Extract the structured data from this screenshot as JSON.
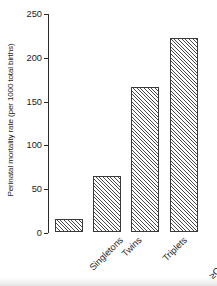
{
  "chart_data": {
    "type": "bar",
    "title": "",
    "subtitle": "",
    "xlabel": "",
    "ylabel": "Perinatal mortality rate (per 1000 total births)",
    "categories": [
      "Singletons",
      "Twins",
      "Triplets",
      "≥Quadruplets"
    ],
    "values": [
      15,
      64,
      165,
      221
    ],
    "ylim": [
      0,
      250
    ],
    "yticks": [
      0,
      50,
      100,
      150,
      200,
      250
    ],
    "ytick_labels": [
      "0",
      "50",
      "100",
      "150",
      "200",
      "250"
    ],
    "grid": false,
    "legend": null,
    "series": [
      {
        "name": "Perinatal mortality rate",
        "values": [
          15,
          64,
          165,
          221
        ]
      }
    ],
    "bar_fill": "hatched-diagonal",
    "bar_edge_color": "#3a3a3a",
    "bar_hatch_color": "#4a4a4a",
    "axis_color": "#2a2a2a",
    "background_color": "#ffffff",
    "xtick_label_rotation": 45
  }
}
